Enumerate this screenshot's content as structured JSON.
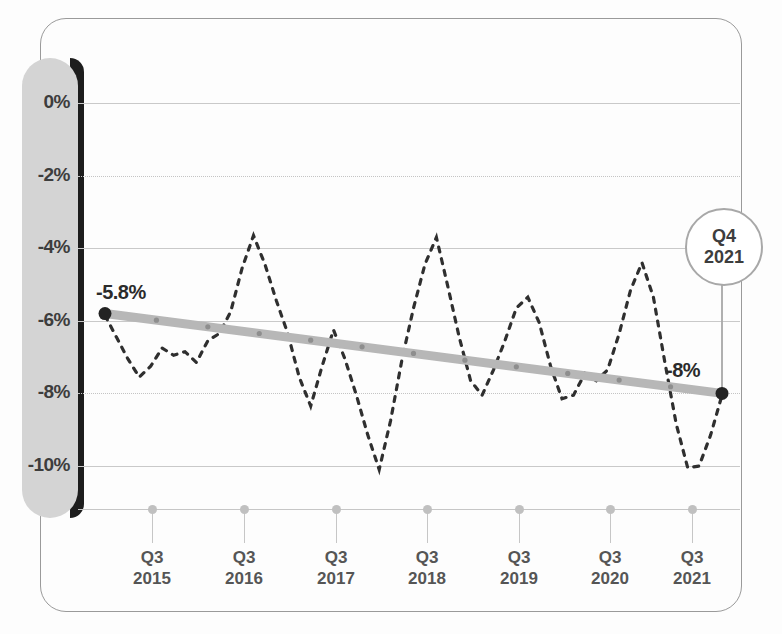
{
  "chart_data": {
    "type": "line",
    "title": "",
    "subtitle": "",
    "xlabel": "",
    "ylabel": "",
    "ylim": [
      -11.0,
      0.6
    ],
    "yticks": [
      0,
      -2,
      -4,
      -6,
      -8,
      -10
    ],
    "ytick_labels": [
      "0%",
      "-2%",
      "-4%",
      "-6%",
      "-8%",
      "-10%"
    ],
    "xtick_labels": [
      {
        "quarter": "Q3",
        "year": "2015"
      },
      {
        "quarter": "Q3",
        "year": "2016"
      },
      {
        "quarter": "Q3",
        "year": "2017"
      },
      {
        "quarter": "Q3",
        "year": "2018"
      },
      {
        "quarter": "Q3",
        "year": "2019"
      },
      {
        "quarter": "Q3",
        "year": "2020"
      },
      {
        "quarter": "Q3",
        "year": "2021"
      }
    ],
    "grid": true,
    "legend_position": "none",
    "series": [
      {
        "name": "quarterly-series",
        "style": "dashed",
        "color": "#2f2f2f",
        "values": [
          -5.85,
          -6.45,
          -7.05,
          -7.55,
          -7.25,
          -6.75,
          -6.95,
          -6.85,
          -7.15,
          -6.55,
          -6.35,
          -5.75,
          -4.55,
          -3.65,
          -4.45,
          -5.45,
          -6.35,
          -7.55,
          -8.35,
          -7.25,
          -6.25,
          -7.05,
          -8.05,
          -9.15,
          -10.1,
          -8.75,
          -7.05,
          -5.65,
          -4.45,
          -3.7,
          -5.05,
          -6.45,
          -7.65,
          -8.05,
          -7.35,
          -6.55,
          -5.65,
          -5.35,
          -6.05,
          -7.25,
          -8.15,
          -8.05,
          -7.45,
          -7.65,
          -7.35,
          -6.35,
          -5.15,
          -4.4,
          -5.35,
          -7.15,
          -8.85,
          -10.05,
          -10.0,
          -9.15,
          -8.05
        ]
      },
      {
        "name": "trend-line",
        "style": "solid-thick",
        "color": "#b7b7b7",
        "start_value": -5.8,
        "end_value": -8.0
      }
    ],
    "annotations": [
      {
        "name": "start-point-label",
        "text": "-5.8%",
        "value": -5.8
      },
      {
        "name": "end-point-label",
        "text": "-8%",
        "value": -8.0
      },
      {
        "name": "callout",
        "line1": "Q4",
        "line2": "2021"
      }
    ],
    "colors": {
      "axis_slab": "#d4d4d4",
      "slab_shadow": "#1d1d1d",
      "gridline": "#c9c9c9",
      "trend": "#b7b7b7",
      "dashed_series": "#2f2f2f",
      "endpoint": "#222222",
      "frame": "#9a9a9a",
      "text": "#3d3d3d"
    }
  }
}
